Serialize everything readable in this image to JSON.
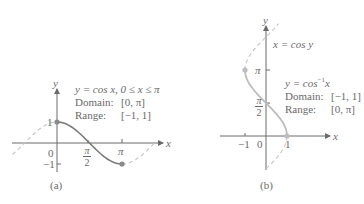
{
  "chart_data": [
    {
      "type": "line",
      "panel": "(a)",
      "title": "y = cos x, 0 ≤ x ≤ π",
      "function": "y = cos x",
      "xlabel": "x",
      "ylabel": "y",
      "domain": "[0, π]",
      "range": "[−1, 1]",
      "x_ticks": [
        "0",
        "π/2",
        "π"
      ],
      "y_ticks": [
        "1",
        "−1"
      ],
      "solid_interval": [
        0,
        3.1416
      ],
      "dashed_intervals": [
        [
          -2.15,
          0
        ],
        [
          3.1416,
          4.7
        ]
      ],
      "endpoints": [
        {
          "x": 0,
          "y": 1
        },
        {
          "x": 3.1416,
          "y": -1
        }
      ],
      "series": [
        {
          "name": "cos x (restricted)",
          "style": "solid",
          "x": [
            0,
            0.7854,
            1.5708,
            2.3562,
            3.1416
          ],
          "y": [
            1,
            0.7071,
            0,
            -0.7071,
            -1
          ]
        }
      ],
      "grid": false,
      "origin_px": [
        57,
        143
      ],
      "scale_px": [
        20.7,
        21
      ]
    },
    {
      "type": "line",
      "panel": "(b)",
      "title": "y = cos⁻¹x",
      "curve_label": "x = cos y",
      "function": "y = cos⁻¹x",
      "xlabel": "x",
      "ylabel": "y",
      "domain": "[−1, 1]",
      "range": "[0, π]",
      "x_ticks": [
        "−1",
        "0",
        "1"
      ],
      "y_ticks": [
        "π/2",
        "π"
      ],
      "solid_interval": [
        0,
        3.1416
      ],
      "dashed_intervals": [
        [
          -1.55,
          0
        ],
        [
          3.1416,
          5.35
        ]
      ],
      "endpoints": [
        {
          "x": 1,
          "y": 0
        },
        {
          "x": -1,
          "y": 3.1416
        }
      ],
      "series": [
        {
          "name": "arccos x",
          "style": "solid",
          "x": [
            1,
            0.7071,
            0,
            -0.7071,
            -1
          ],
          "y": [
            0,
            0.7854,
            1.5708,
            2.3562,
            3.1416
          ]
        }
      ],
      "grid": false,
      "origin_px": [
        266,
        136
      ],
      "scale_px": [
        21,
        21
      ]
    }
  ],
  "panel_a": {
    "y_axis_label": "y",
    "x_axis_label": "x",
    "equation": "y = cos x, 0 ≤ x ≤ π",
    "domain_label": "Domain:",
    "domain_value": "[0, π]",
    "range_label": "Range:",
    "range_value": "[−1, 1]",
    "tick_one": "1",
    "tick_neg_one": "−1",
    "tick_zero": "0",
    "tick_pi": "π",
    "tick_pi_num": "π",
    "tick_pi_den": "2",
    "caption": "(a)"
  },
  "panel_b": {
    "y_axis_label": "y",
    "x_axis_label": "x",
    "curve_label": "x = cos y",
    "equation_prefix": "y = cos",
    "equation_sup": "−1",
    "equation_suffix": "x",
    "domain_label": "Domain:",
    "domain_value": "[−1, 1]",
    "range_label": "Range:",
    "range_value": "[0, π]",
    "tick_neg_one": "−1",
    "tick_zero": "0",
    "tick_one": "1",
    "tick_pi": "π",
    "tick_pi_num": "π",
    "tick_pi_den": "2",
    "caption": "(b)"
  },
  "colors": {
    "axis": "#6a6a6a",
    "solid_curve": "#7a7a7a",
    "solid_curve_b": "#bdbdbd",
    "dashed_curve": "#c4c4c4",
    "point": "#8a8a8a",
    "point_b": "#bdbdbd"
  }
}
